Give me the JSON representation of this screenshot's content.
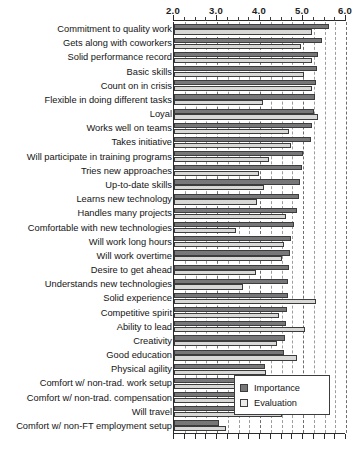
{
  "chart_data": {
    "type": "bar",
    "orientation": "horizontal",
    "title": "",
    "subtitle": "",
    "xlabel": "",
    "ylabel": "",
    "xlim": [
      2.0,
      6.0
    ],
    "xticks": [
      2.0,
      3.0,
      4.0,
      5.0,
      6.0
    ],
    "xtick_labels": [
      "2.0",
      "3.0",
      "4.0",
      "5.0",
      "6.0"
    ],
    "minor_tick_step": 0.25,
    "grid": true,
    "grid_style": "dashed",
    "grid_axis": "x",
    "axis_label_position": "top",
    "legend_position": "lower right (inside plot)",
    "categories": [
      "Commitment to quality work",
      "Gets along with coworkers",
      "Solid performance record",
      "Basic skills",
      "Count on in crisis",
      "Flexible in doing different tasks",
      "Loyal",
      "Works well on teams",
      "Takes initiative",
      "Will participate in training programs",
      "Tries new approaches",
      "Up-to-date skills",
      "Learns new technology",
      "Handles many projects",
      "Comfortable with new technologies",
      "Will work long hours",
      "Will work overtime",
      "Desire to get ahead",
      "Understands new technologies",
      "Solid experience",
      "Competitive spirit",
      "Ability to lead",
      "Creativity",
      "Good education",
      "Physical agility",
      "Comfort w/ non-trad. work setup",
      "Comfort w/ non-trad. compensation",
      "Will travel",
      "Comfort w/ non-FT employment setup"
    ],
    "series": [
      {
        "name": "Importance",
        "color": "#77777a",
        "values": [
          5.6,
          5.45,
          5.35,
          5.33,
          5.3,
          5.28,
          5.25,
          5.2,
          5.18,
          5.0,
          4.97,
          4.93,
          4.9,
          4.85,
          4.8,
          4.72,
          4.7,
          4.68,
          4.66,
          4.65,
          4.62,
          4.6,
          4.58,
          4.55,
          4.12,
          4.05,
          3.88,
          3.48,
          3.05
        ]
      },
      {
        "name": "Evaluation",
        "color": "#d8d8d6",
        "values": [
          5.22,
          4.95,
          5.2,
          5.03,
          5.22,
          4.08,
          5.35,
          4.68,
          4.72,
          4.22,
          3.98,
          4.1,
          3.92,
          4.6,
          3.45,
          4.55,
          4.52,
          3.9,
          3.6,
          5.3,
          4.45,
          5.05,
          4.4,
          4.85,
          4.15,
          4.08,
          3.83,
          4.5,
          3.22
        ]
      }
    ]
  },
  "legend": {
    "entries": [
      {
        "label": "Importance",
        "swatch": "importance-swatch"
      },
      {
        "label": "Evaluation",
        "swatch": "evaluation-swatch"
      }
    ]
  }
}
